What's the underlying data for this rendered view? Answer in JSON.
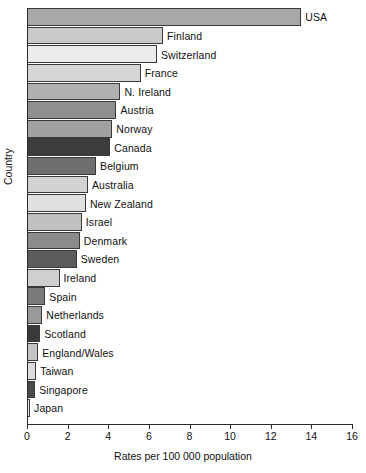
{
  "chart_data": {
    "type": "bar",
    "orientation": "horizontal",
    "title": "",
    "xlabel": "Rates per 100 000 population",
    "ylabel": "Country",
    "xlim": [
      0,
      16
    ],
    "xticks": [
      0,
      2,
      4,
      6,
      8,
      10,
      12,
      14,
      16
    ],
    "xtick_labels": [
      "0",
      "2",
      "4",
      "6",
      "8",
      "10",
      "12",
      "14",
      "16"
    ],
    "grid": false,
    "legend": "none",
    "categories": [
      "USA",
      "Finland",
      "Switzerland",
      "France",
      "N. Ireland",
      "Austria",
      "Norway",
      "Canada",
      "Belgium",
      "Australia",
      "New Zealand",
      "Israel",
      "Denmark",
      "Sweden",
      "Ireland",
      "Spain",
      "Netherlands",
      "Scotland",
      "England/Wales",
      "Taiwan",
      "Singapore",
      "Japan"
    ],
    "values": [
      13.5,
      6.7,
      6.4,
      5.6,
      4.6,
      4.4,
      4.2,
      4.1,
      3.4,
      3.0,
      2.9,
      2.7,
      2.6,
      2.45,
      1.6,
      0.9,
      0.75,
      0.65,
      0.55,
      0.45,
      0.4,
      0.15
    ],
    "bar_colors": [
      "#a8a8a8",
      "#c9c9c9",
      "#ececec",
      "#d6d6d6",
      "#b0b0b0",
      "#8f8f8f",
      "#a0a0a0",
      "#3c3c3c",
      "#6e6e6e",
      "#d2d2d2",
      "#e0e0e0",
      "#c0c0c0",
      "#8b8b8b",
      "#5c5c5c",
      "#cfcfcf",
      "#7a7a7a",
      "#9a9a9a",
      "#3a3a3a",
      "#c4c4c4",
      "#dcdcdc",
      "#4a4a4a",
      "#e8e8e8"
    ],
    "bars": [
      {
        "label": "USA",
        "value": 13.5,
        "color": "#a8a8a8"
      },
      {
        "label": "Finland",
        "value": 6.7,
        "color": "#c9c9c9"
      },
      {
        "label": "Switzerland",
        "value": 6.4,
        "color": "#ececec"
      },
      {
        "label": "France",
        "value": 5.6,
        "color": "#d6d6d6"
      },
      {
        "label": "N. Ireland",
        "value": 4.6,
        "color": "#b0b0b0"
      },
      {
        "label": "Austria",
        "value": 4.4,
        "color": "#8f8f8f"
      },
      {
        "label": "Norway",
        "value": 4.2,
        "color": "#a0a0a0"
      },
      {
        "label": "Canada",
        "value": 4.1,
        "color": "#3c3c3c"
      },
      {
        "label": "Belgium",
        "value": 3.4,
        "color": "#6e6e6e"
      },
      {
        "label": "Australia",
        "value": 3.0,
        "color": "#d2d2d2"
      },
      {
        "label": "New Zealand",
        "value": 2.9,
        "color": "#e0e0e0"
      },
      {
        "label": "Israel",
        "value": 2.7,
        "color": "#c0c0c0"
      },
      {
        "label": "Denmark",
        "value": 2.6,
        "color": "#8b8b8b"
      },
      {
        "label": "Sweden",
        "value": 2.45,
        "color": "#5c5c5c"
      },
      {
        "label": "Ireland",
        "value": 1.6,
        "color": "#cfcfcf"
      },
      {
        "label": "Spain",
        "value": 0.9,
        "color": "#7a7a7a"
      },
      {
        "label": "Netherlands",
        "value": 0.75,
        "color": "#9a9a9a"
      },
      {
        "label": "Scotland",
        "value": 0.65,
        "color": "#3a3a3a"
      },
      {
        "label": "England/Wales",
        "value": 0.55,
        "color": "#c4c4c4"
      },
      {
        "label": "Taiwan",
        "value": 0.45,
        "color": "#dcdcdc"
      },
      {
        "label": "Singapore",
        "value": 0.4,
        "color": "#4a4a4a"
      },
      {
        "label": "Japan",
        "value": 0.15,
        "color": "#e8e8e8"
      }
    ]
  }
}
